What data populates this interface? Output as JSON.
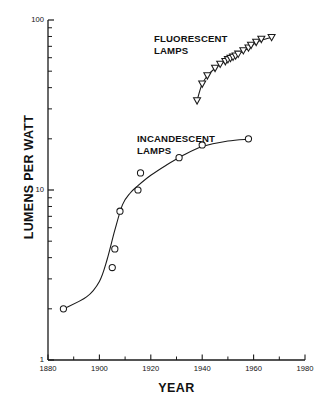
{
  "chart_data": {
    "type": "scatter",
    "title": "",
    "xlabel": "YEAR",
    "ylabel": "LUMENS PER WATT",
    "xlim": [
      1880,
      1980
    ],
    "ylim": [
      1,
      100
    ],
    "yscale": "log",
    "xscale": "linear",
    "grid": false,
    "legend": "none (inline annotations)",
    "x_ticks_major": [
      "1880",
      "1900",
      "1920",
      "1940",
      "1960",
      "1980"
    ],
    "x_tick_values_major": [
      1880,
      1900,
      1920,
      1940,
      1960,
      1980
    ],
    "x_tick_values_minor": [
      1890,
      1910,
      1930,
      1950,
      1970
    ],
    "y_ticks_major": [
      "1",
      "10",
      "100"
    ],
    "y_tick_values_major": [
      1,
      10,
      100
    ],
    "y_tick_values_minor": [
      2,
      3,
      4,
      5,
      6,
      7,
      8,
      9,
      20,
      30,
      40,
      50,
      60,
      70,
      80,
      90
    ],
    "annotations": [
      {
        "name": "fluorescent-label",
        "text": "FLUORESCENT\nLAMPS",
        "x": 1921,
        "y": 55
      },
      {
        "name": "incandescent-label",
        "text": "INCANDESCENT\nLAMPS",
        "x": 1915,
        "y": 26
      }
    ],
    "series": [
      {
        "name": "INCANDESCENT LAMPS",
        "marker": "circle-open",
        "color": "#1a1a1a",
        "points": [
          {
            "x": 1886,
            "y": 2.0
          },
          {
            "x": 1905,
            "y": 3.5
          },
          {
            "x": 1906,
            "y": 4.5
          },
          {
            "x": 1908,
            "y": 7.5
          },
          {
            "x": 1915,
            "y": 10.0
          },
          {
            "x": 1916,
            "y": 12.6
          },
          {
            "x": 1931,
            "y": 15.5
          },
          {
            "x": 1940,
            "y": 18.4
          },
          {
            "x": 1958,
            "y": 20.0
          }
        ],
        "fit_curve": [
          {
            "x": 1886,
            "y": 2.0
          },
          {
            "x": 1895,
            "y": 2.35
          },
          {
            "x": 1900,
            "y": 2.9
          },
          {
            "x": 1903,
            "y": 3.9
          },
          {
            "x": 1906,
            "y": 5.8
          },
          {
            "x": 1909,
            "y": 8.2
          },
          {
            "x": 1912,
            "y": 9.6
          },
          {
            "x": 1915,
            "y": 10.6
          },
          {
            "x": 1920,
            "y": 12.2
          },
          {
            "x": 1926,
            "y": 14.0
          },
          {
            "x": 1932,
            "y": 15.8
          },
          {
            "x": 1940,
            "y": 18.0
          },
          {
            "x": 1950,
            "y": 19.4
          },
          {
            "x": 1958,
            "y": 19.9
          }
        ]
      },
      {
        "name": "FLUORESCENT LAMPS",
        "marker": "triangle-down-open",
        "color": "#1a1a1a",
        "points": [
          {
            "x": 1938,
            "y": 33.5
          },
          {
            "x": 1940,
            "y": 42.0
          },
          {
            "x": 1942,
            "y": 47.0
          },
          {
            "x": 1945,
            "y": 52.0
          },
          {
            "x": 1947,
            "y": 55.0
          },
          {
            "x": 1949,
            "y": 57.0
          },
          {
            "x": 1950,
            "y": 58.5
          },
          {
            "x": 1951,
            "y": 59.5
          },
          {
            "x": 1952,
            "y": 60.5
          },
          {
            "x": 1953,
            "y": 61.5
          },
          {
            "x": 1954,
            "y": 63.0
          },
          {
            "x": 1956,
            "y": 66.0
          },
          {
            "x": 1958,
            "y": 68.5
          },
          {
            "x": 1959,
            "y": 71.0
          },
          {
            "x": 1961,
            "y": 74.0
          },
          {
            "x": 1963,
            "y": 77.0
          },
          {
            "x": 1967,
            "y": 79.0
          }
        ],
        "fit_curve": [
          {
            "x": 1938,
            "y": 33.5
          },
          {
            "x": 1939,
            "y": 38.0
          },
          {
            "x": 1940,
            "y": 42.0
          },
          {
            "x": 1942,
            "y": 47.0
          },
          {
            "x": 1945,
            "y": 52.0
          },
          {
            "x": 1948,
            "y": 56.0
          },
          {
            "x": 1951,
            "y": 59.5
          },
          {
            "x": 1954,
            "y": 63.0
          },
          {
            "x": 1958,
            "y": 68.5
          },
          {
            "x": 1962,
            "y": 75.0
          },
          {
            "x": 1967,
            "y": 79.0
          }
        ]
      }
    ]
  },
  "axes": {
    "x_title": "YEAR",
    "y_title": "LUMENS PER WATT"
  },
  "colors": {
    "ink": "#1a1a1a",
    "background": "#ffffff"
  }
}
